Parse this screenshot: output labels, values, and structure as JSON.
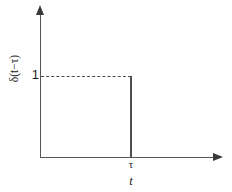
{
  "figure": {
    "title": "",
    "background_color": "#ffffff",
    "axis_color": "#555555",
    "curve_color": "#4f4f4f",
    "dashed_color": "#4a4a4a"
  },
  "axes": {
    "y_label": "δ(t−τ)",
    "x_label": "t",
    "y_ticks": [
      "1"
    ],
    "x_ticks": [
      "τ"
    ],
    "y_arrow_icon": "arrow-up-icon",
    "x_arrow_icon": "arrow-right-icon"
  },
  "chart_data": {
    "type": "line",
    "title": "",
    "xlabel": "t",
    "ylabel": "δ(t−τ)",
    "xlim": [
      0,
      1.45
    ],
    "ylim": [
      0,
      1.32
    ],
    "grid": false,
    "legend": "none",
    "x_tick_values": [
      1.0
    ],
    "x_tick_labels": [
      "τ"
    ],
    "y_tick_values": [
      1.0
    ],
    "y_tick_labels": [
      "1"
    ],
    "series": [
      {
        "name": "impulse-spike",
        "style": "solid",
        "x": [
          1.0,
          1.0
        ],
        "values": [
          0,
          1
        ]
      },
      {
        "name": "unit-reference",
        "style": "dashed",
        "x": [
          0.0,
          1.0
        ],
        "values": [
          1,
          1
        ]
      }
    ],
    "annotations": [
      {
        "name": "spike-position",
        "text": "τ",
        "x": 1.0,
        "y": 0
      },
      {
        "name": "unit-height",
        "text": "1",
        "x": 0.0,
        "y": 1.0
      }
    ]
  }
}
